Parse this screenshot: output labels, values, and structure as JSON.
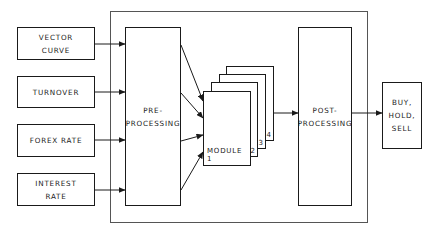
{
  "diagram": {
    "type": "block-diagram",
    "inputs": [
      {
        "id": "vector-curve",
        "label": "VECTOR\nCURVE"
      },
      {
        "id": "turnover",
        "label": "TURNOVER"
      },
      {
        "id": "forex-rate",
        "label": "FOREX RATE"
      },
      {
        "id": "interest-rate",
        "label": "INTEREST\nRATE"
      }
    ],
    "preprocessing": {
      "label": "PRE-\nPROCESSING"
    },
    "modules": [
      {
        "label": "MODULE 1",
        "number": "1"
      },
      {
        "number": "2"
      },
      {
        "number": "3"
      },
      {
        "number": "4"
      }
    ],
    "postprocessing": {
      "label": "POST-\nPROCESSING"
    },
    "output": {
      "label": "BUY,\nHOLD,\nSELL"
    },
    "colors": {
      "line": "#1a1a1a",
      "outer_frame": "#555555",
      "background": "#ffffff"
    }
  }
}
